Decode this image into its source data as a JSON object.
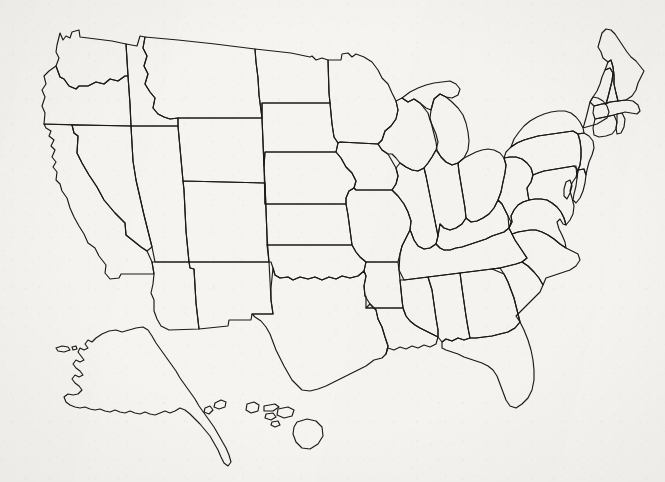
{
  "document": {
    "kind": "map",
    "title": "Blank United States State Outline Map",
    "subject": "United States of America",
    "label_text": "",
    "has_labels": false,
    "has_legend": false,
    "has_title_text": false,
    "has_scale_bar": false,
    "has_compass_rose": false,
    "has_grid": false,
    "projection_style": "flattened-conic",
    "medium": "scanned paper line drawing"
  },
  "colors": {
    "paper_background": "#f5f4f1",
    "outline_stroke": "#1b1b1b",
    "fill": "none",
    "page_background": "#ffffff"
  },
  "canvas": {
    "width": 665,
    "height": 482,
    "map_bounds": {
      "left": 36,
      "top": 28,
      "right": 645,
      "bottom": 470
    }
  },
  "map": {
    "region_groups": [
      {
        "name": "contiguous-united-states",
        "label": "Contiguous United States",
        "state_count": 48
      },
      {
        "name": "alaska-inset",
        "label": "Alaska",
        "state_count": 1,
        "position": "lower-left"
      },
      {
        "name": "hawaii-inset",
        "label": "Hawaii",
        "state_count": 1,
        "position": "lower-center"
      }
    ],
    "states": [
      {
        "code": "WA",
        "name": "Washington",
        "group": "contiguous-united-states"
      },
      {
        "code": "OR",
        "name": "Oregon",
        "group": "contiguous-united-states"
      },
      {
        "code": "CA",
        "name": "California",
        "group": "contiguous-united-states"
      },
      {
        "code": "NV",
        "name": "Nevada",
        "group": "contiguous-united-states"
      },
      {
        "code": "ID",
        "name": "Idaho",
        "group": "contiguous-united-states"
      },
      {
        "code": "MT",
        "name": "Montana",
        "group": "contiguous-united-states"
      },
      {
        "code": "WY",
        "name": "Wyoming",
        "group": "contiguous-united-states"
      },
      {
        "code": "UT",
        "name": "Utah",
        "group": "contiguous-united-states"
      },
      {
        "code": "AZ",
        "name": "Arizona",
        "group": "contiguous-united-states"
      },
      {
        "code": "CO",
        "name": "Colorado",
        "group": "contiguous-united-states"
      },
      {
        "code": "NM",
        "name": "New Mexico",
        "group": "contiguous-united-states"
      },
      {
        "code": "ND",
        "name": "North Dakota",
        "group": "contiguous-united-states"
      },
      {
        "code": "SD",
        "name": "South Dakota",
        "group": "contiguous-united-states"
      },
      {
        "code": "NE",
        "name": "Nebraska",
        "group": "contiguous-united-states"
      },
      {
        "code": "KS",
        "name": "Kansas",
        "group": "contiguous-united-states"
      },
      {
        "code": "OK",
        "name": "Oklahoma",
        "group": "contiguous-united-states"
      },
      {
        "code": "TX",
        "name": "Texas",
        "group": "contiguous-united-states"
      },
      {
        "code": "MN",
        "name": "Minnesota",
        "group": "contiguous-united-states"
      },
      {
        "code": "IA",
        "name": "Iowa",
        "group": "contiguous-united-states"
      },
      {
        "code": "MO",
        "name": "Missouri",
        "group": "contiguous-united-states"
      },
      {
        "code": "AR",
        "name": "Arkansas",
        "group": "contiguous-united-states"
      },
      {
        "code": "LA",
        "name": "Louisiana",
        "group": "contiguous-united-states"
      },
      {
        "code": "WI",
        "name": "Wisconsin",
        "group": "contiguous-united-states"
      },
      {
        "code": "IL",
        "name": "Illinois",
        "group": "contiguous-united-states"
      },
      {
        "code": "MI",
        "name": "Michigan",
        "group": "contiguous-united-states"
      },
      {
        "code": "IN",
        "name": "Indiana",
        "group": "contiguous-united-states"
      },
      {
        "code": "OH",
        "name": "Ohio",
        "group": "contiguous-united-states"
      },
      {
        "code": "KY",
        "name": "Kentucky",
        "group": "contiguous-united-states"
      },
      {
        "code": "TN",
        "name": "Tennessee",
        "group": "contiguous-united-states"
      },
      {
        "code": "MS",
        "name": "Mississippi",
        "group": "contiguous-united-states"
      },
      {
        "code": "AL",
        "name": "Alabama",
        "group": "contiguous-united-states"
      },
      {
        "code": "GA",
        "name": "Georgia",
        "group": "contiguous-united-states"
      },
      {
        "code": "FL",
        "name": "Florida",
        "group": "contiguous-united-states"
      },
      {
        "code": "SC",
        "name": "South Carolina",
        "group": "contiguous-united-states"
      },
      {
        "code": "NC",
        "name": "North Carolina",
        "group": "contiguous-united-states"
      },
      {
        "code": "VA",
        "name": "Virginia",
        "group": "contiguous-united-states"
      },
      {
        "code": "WV",
        "name": "West Virginia",
        "group": "contiguous-united-states"
      },
      {
        "code": "MD",
        "name": "Maryland",
        "group": "contiguous-united-states"
      },
      {
        "code": "DE",
        "name": "Delaware",
        "group": "contiguous-united-states"
      },
      {
        "code": "PA",
        "name": "Pennsylvania",
        "group": "contiguous-united-states"
      },
      {
        "code": "NJ",
        "name": "New Jersey",
        "group": "contiguous-united-states"
      },
      {
        "code": "NY",
        "name": "New York",
        "group": "contiguous-united-states"
      },
      {
        "code": "CT",
        "name": "Connecticut",
        "group": "contiguous-united-states"
      },
      {
        "code": "RI",
        "name": "Rhode Island",
        "group": "contiguous-united-states"
      },
      {
        "code": "MA",
        "name": "Massachusetts",
        "group": "contiguous-united-states"
      },
      {
        "code": "VT",
        "name": "Vermont",
        "group": "contiguous-united-states"
      },
      {
        "code": "NH",
        "name": "New Hampshire",
        "group": "contiguous-united-states"
      },
      {
        "code": "ME",
        "name": "Maine",
        "group": "contiguous-united-states"
      },
      {
        "code": "AK",
        "name": "Alaska",
        "group": "alaska-inset"
      },
      {
        "code": "HI",
        "name": "Hawaii",
        "group": "hawaii-inset"
      }
    ]
  }
}
